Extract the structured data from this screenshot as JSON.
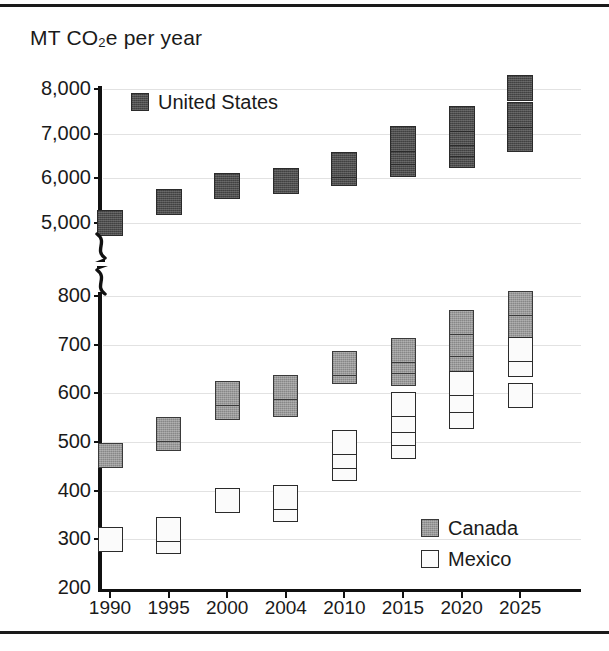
{
  "figure": {
    "axis_title": "MT CO",
    "axis_title_sub": "2",
    "axis_title_tail": "e per year"
  },
  "legend": {
    "united_states": "United States",
    "canada": "Canada",
    "mexico": "Mexico"
  },
  "colors": {
    "united_states": "#4d4d4d",
    "canada": "#9a9a9a",
    "mexico": "#fbfbfb",
    "marker_outline": "#2b2b2b",
    "gridline": "#e2e2e2",
    "axis": "#111111",
    "background": "#ffffff"
  },
  "chart_data": {
    "type": "scatter",
    "title": "MT CO2e per year",
    "xlabel": "",
    "ylabel": "MT CO2e per year",
    "grid": true,
    "legend_position": "inside",
    "broken_axis": true,
    "axis_note": "Y axis is broken between 800 and 5,000",
    "upper_panel": {
      "ylim": [
        5000,
        8000
      ],
      "yticks": [
        5000,
        6000,
        7000,
        8000
      ],
      "ytick_labels": [
        "5,000",
        "6,000",
        "7,000",
        "8,000"
      ]
    },
    "lower_panel": {
      "ylim": [
        200,
        800
      ],
      "yticks": [
        200,
        300,
        400,
        500,
        600,
        700,
        800
      ],
      "ytick_labels": [
        "200",
        "300",
        "400",
        "500",
        "600",
        "700",
        "800"
      ]
    },
    "categories": [
      "1990",
      "1995",
      "2000",
      "2004",
      "2010",
      "2015",
      "2020",
      "2025"
    ],
    "series": [
      {
        "name": "United States",
        "panel": "upper",
        "values_by_year": {
          "1990": [
            4990
          ],
          "1995": [
            5475
          ],
          "2000": [
            5820
          ],
          "2004": [
            5940
          ],
          "2010": [
            6130,
            6290
          ],
          "2015": [
            6320,
            6600,
            6870
          ],
          "2020": [
            6530,
            6760,
            7010,
            7330
          ],
          "2025": [
            6880,
            7420,
            8020
          ]
        }
      },
      {
        "name": "Canada",
        "panel": "lower",
        "values_by_year": {
          "1990": [
            472
          ],
          "1995": [
            508,
            525
          ],
          "2000": [
            570,
            600
          ],
          "2004": [
            578,
            612
          ],
          "2010": [
            645,
            662
          ],
          "2015": [
            640,
            665,
            688
          ],
          "2020": [
            655,
            700,
            745
          ],
          "2025": [
            672,
            700,
            740,
            785
          ]
        }
      },
      {
        "name": "Mexico",
        "panel": "lower",
        "values_by_year": {
          "1990": [
            300
          ],
          "1995": [
            295,
            320
          ],
          "2000": [
            380
          ],
          "2004": [
            362,
            385
          ],
          "2010": [
            445,
            470,
            498
          ],
          "2015": [
            490,
            518,
            545,
            578
          ],
          "2020": [
            552,
            585,
            620
          ],
          "2025": [
            595,
            660,
            690
          ]
        }
      }
    ]
  }
}
